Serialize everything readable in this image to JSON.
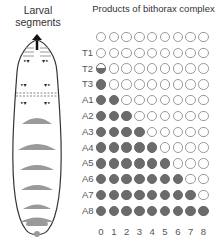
{
  "larva": {
    "title_line1": "Larval",
    "title_line2": "segments"
  },
  "grid": {
    "title": "Products of bithorax complex",
    "filled_color": "#6b6b6b",
    "empty_stroke": "#9a9a9a"
  },
  "chart_data": {
    "type": "table",
    "title": "Products of bithorax complex",
    "row_labels": [
      "",
      "T1",
      "T2",
      "T3",
      "A1",
      "A2",
      "A3",
      "A4",
      "A5",
      "A6",
      "A7",
      "A8"
    ],
    "column_labels": [
      "0",
      "1",
      "2",
      "3",
      "4",
      "5",
      "6",
      "7",
      "8"
    ],
    "filled_counts": [
      0,
      0,
      0.5,
      1,
      2,
      3,
      4,
      5,
      6,
      7,
      8,
      9
    ]
  }
}
